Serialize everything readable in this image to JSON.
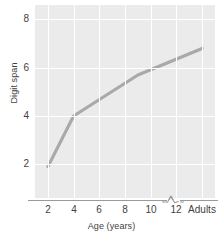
{
  "chart_data": {
    "type": "line",
    "title": "",
    "xlabel": "Age (years)",
    "ylabel": "Digit span",
    "categories": [
      "2",
      "4",
      "6",
      "8",
      "10",
      "12",
      "Adults"
    ],
    "x_tick_labels": [
      "2",
      "4",
      "6",
      "8",
      "10",
      "12",
      "Adults"
    ],
    "y_tick_labels": [
      "2",
      "4",
      "6",
      "8"
    ],
    "y_ticks": [
      2,
      4,
      6,
      8
    ],
    "xlim": [
      1,
      15
    ],
    "ylim": [
      0.6,
      8.6
    ],
    "grid": true,
    "legend": false,
    "axis_break": true,
    "axis_break_between": [
      "12",
      "Adults"
    ],
    "series": [
      {
        "name": "Digit span",
        "x": [
          2,
          4,
          9,
          14
        ],
        "x_labels": [
          "2",
          "4",
          "9",
          "Adults"
        ],
        "values": [
          1.9,
          4.0,
          5.7,
          6.8
        ],
        "color": "#a9a9a9"
      }
    ],
    "colors": {
      "line": "#a9a9a9",
      "plot_background": "#ebebeb",
      "gridline": "#ffffff",
      "axis": "#9a9a9a",
      "text": "#3f3f3f"
    }
  }
}
